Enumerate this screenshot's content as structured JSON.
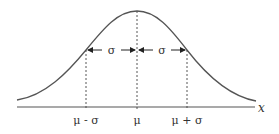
{
  "diagram": {
    "axis_label": "x",
    "tick_labels": [
      "μ - σ",
      "μ",
      "μ + σ"
    ],
    "sigma_labels": [
      "σ",
      "σ"
    ],
    "colors": {
      "curve": "#555555",
      "axis": "#555555",
      "text": "#333333"
    }
  }
}
